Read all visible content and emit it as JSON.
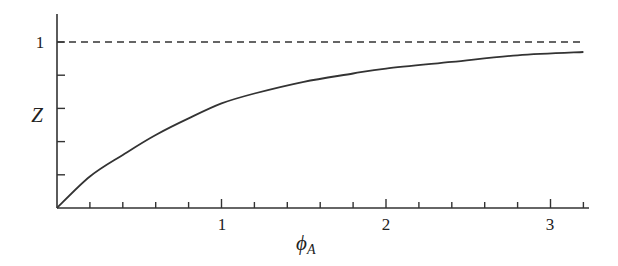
{
  "chart_data": {
    "type": "line",
    "title": "",
    "xlabel": "φ_A",
    "ylabel": "Z",
    "xlim": [
      0,
      3.2
    ],
    "ylim": [
      0,
      1.15
    ],
    "x_ticks_major": [
      1,
      2,
      3
    ],
    "x_tick_labels": [
      "1",
      "2",
      "3"
    ],
    "x_minor_step": 0.2,
    "y_ticks": [
      0.2,
      0.4,
      0.6,
      0.8,
      1.0
    ],
    "y_tick_labels": [
      "1"
    ],
    "grid": false,
    "legend": null,
    "series": [
      {
        "name": "Z(φ_A)",
        "style": "solid",
        "x": [
          0,
          0.2,
          0.4,
          0.6,
          0.8,
          1.0,
          1.2,
          1.5,
          1.8,
          2.0,
          2.4,
          2.8,
          3.2
        ],
        "y": [
          0,
          0.19,
          0.32,
          0.44,
          0.54,
          0.63,
          0.69,
          0.76,
          0.81,
          0.84,
          0.88,
          0.92,
          0.94
        ]
      },
      {
        "name": "asymptote Z = 1",
        "style": "dashed",
        "x": [
          0,
          3.2
        ],
        "y": [
          1,
          1
        ]
      }
    ]
  },
  "labels": {
    "y_axis": "Z",
    "x_axis_main": "ϕ",
    "x_axis_sub": "A",
    "y_one": "1",
    "x_one": "1",
    "x_two": "2",
    "x_three": "3"
  }
}
